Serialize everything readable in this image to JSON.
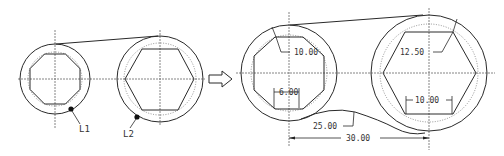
{
  "diagram": {
    "stroke_color": "#2a2a2a",
    "center_line_color": "#555555",
    "before": {
      "labels": {
        "l1": "L1",
        "l2": "L2"
      },
      "circle1": {
        "inner_shape": "octagon"
      },
      "circle2": {
        "inner_shape": "hexagon"
      }
    },
    "arrow": {
      "icon": "right-arrow-icon"
    },
    "after": {
      "dimensions": {
        "left_radius": "10.00",
        "left_octagon_width": "6.00",
        "right_radius": "12.50",
        "right_hexagon_width": "10.00",
        "fillet_radius": "25.00",
        "center_distance": "30.00"
      }
    }
  }
}
